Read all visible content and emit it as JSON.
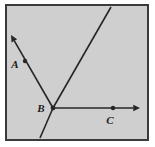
{
  "figure": {
    "frame": {
      "background_color": "#cfcfcf",
      "border_color": "#3a3a3a",
      "outer_background_color": "#ffffff",
      "x": 6,
      "y": 5,
      "width": 142,
      "height": 135,
      "border_width": 2
    },
    "stroke_color": "#262626",
    "stroke_width": 1.6,
    "points": [
      {
        "name": "A",
        "label": "A",
        "x": 25,
        "y": 61,
        "label_x": 15,
        "label_y": 68,
        "dot_radius": 2.2
      },
      {
        "name": "B",
        "label": "B",
        "x": 53,
        "y": 108,
        "label_x": 41,
        "label_y": 112,
        "dot_radius": 2.4
      },
      {
        "name": "C",
        "label": "C",
        "x": 113,
        "y": 108,
        "label_x": 110,
        "label_y": 124,
        "dot_radius": 2.2
      }
    ],
    "segments": [
      {
        "name": "ray-BA",
        "description": "Ray from B through A with arrowhead at upper left",
        "x1": 53,
        "y1": 108,
        "x2": 11,
        "y2": 35,
        "arrow_start": false,
        "arrow_end": true
      },
      {
        "name": "line-through-B-upper-right",
        "description": "Line through B rising to upper right, exits top edge",
        "x1": 53,
        "y1": 108,
        "x2": 111,
        "y2": 7,
        "arrow_start": false,
        "arrow_end": false
      },
      {
        "name": "line-through-B-lower-left",
        "description": "Continuation of the rising line below B, exits bottom edge",
        "x1": 53,
        "y1": 108,
        "x2": 40,
        "y2": 138,
        "arrow_start": false,
        "arrow_end": false
      },
      {
        "name": "ray-BC",
        "description": "Horizontal ray from B through C with arrowhead at right",
        "x1": 53,
        "y1": 108,
        "x2": 140,
        "y2": 108,
        "arrow_start": false,
        "arrow_end": true
      }
    ]
  }
}
